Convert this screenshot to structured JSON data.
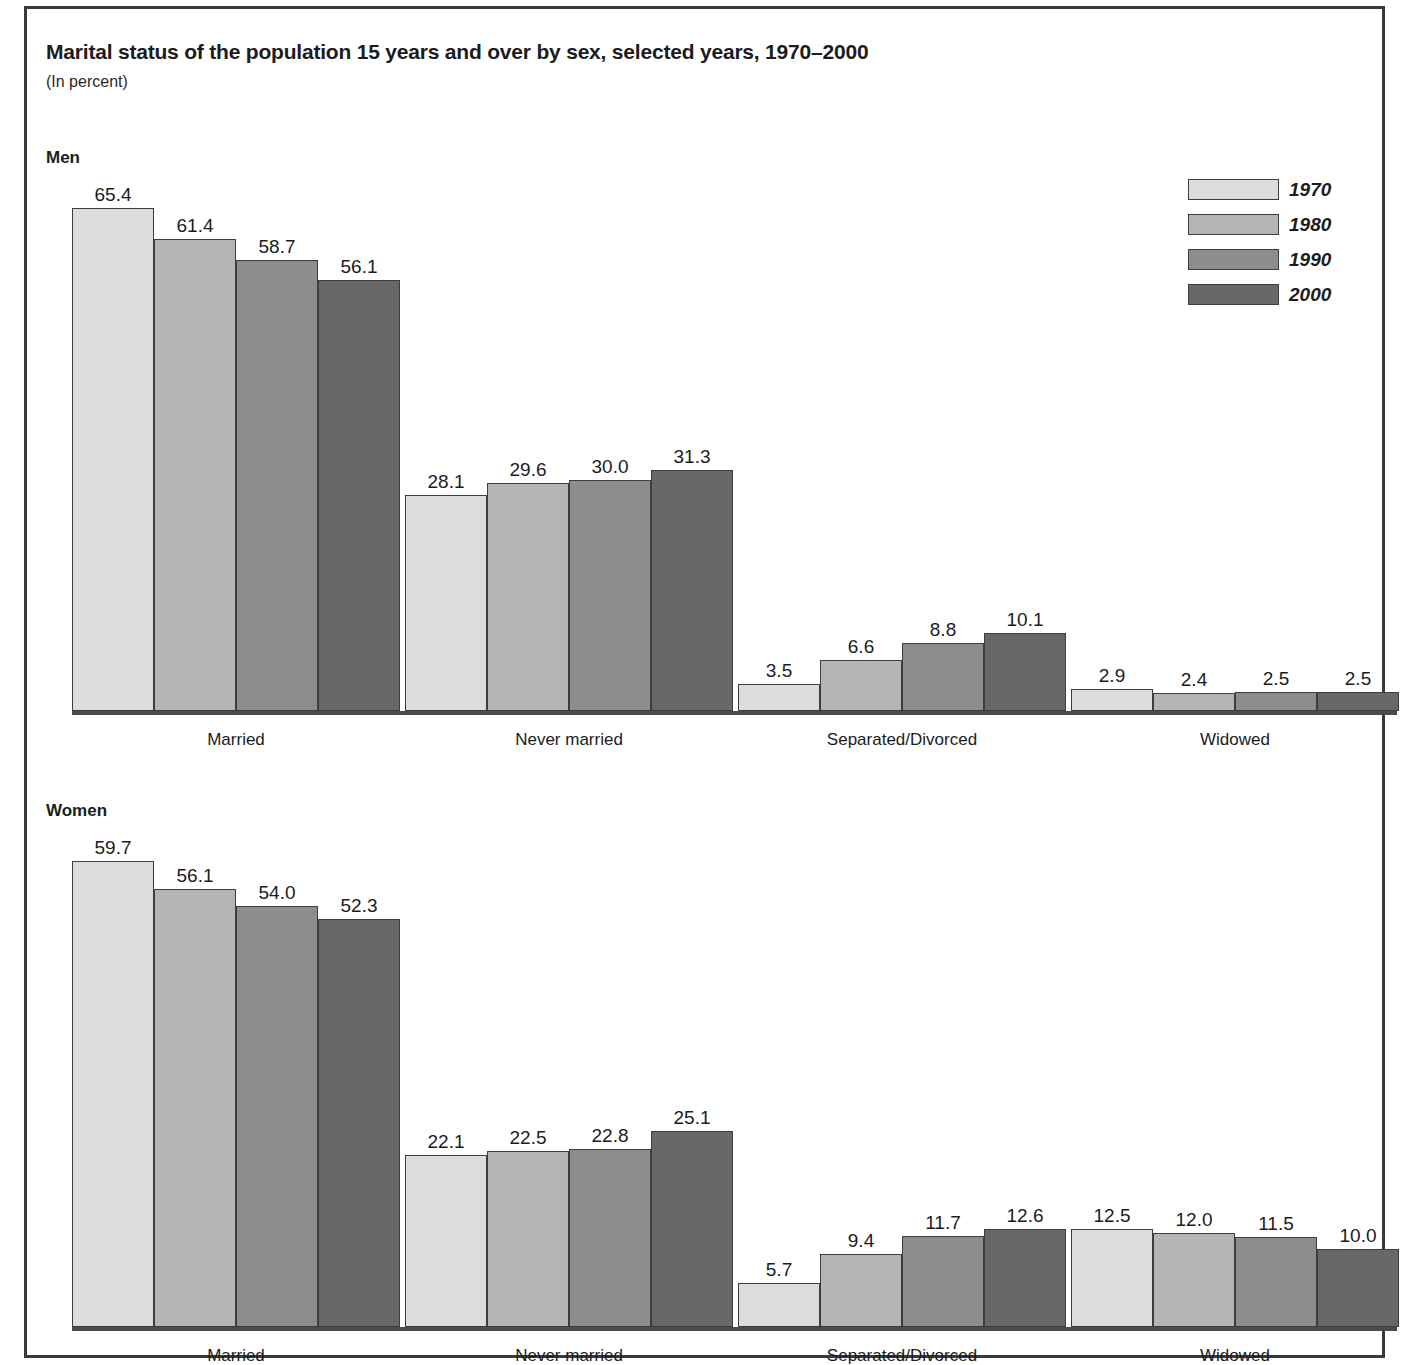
{
  "header": {
    "title": "Marital status of the population 15 years and over by sex, selected years, 1970–2000",
    "subtitle": "(In percent)"
  },
  "panels": [
    {
      "label": "Men"
    },
    {
      "label": "Women"
    }
  ],
  "legend": {
    "position": "top-right",
    "items": [
      {
        "label": "1970",
        "color": "#dcdcdc"
      },
      {
        "label": "1980",
        "color": "#b5b5b5"
      },
      {
        "label": "1990",
        "color": "#8d8d8d"
      },
      {
        "label": "2000",
        "color": "#686868"
      }
    ]
  },
  "chart_data": [
    {
      "type": "bar",
      "title": "Men",
      "xlabel": "",
      "ylabel": "Percent",
      "ylim": [
        0,
        70
      ],
      "grid": false,
      "legend_position": "top-right",
      "categories": [
        "Married",
        "Never married",
        "Separated/Divorced",
        "Widowed"
      ],
      "series": [
        {
          "name": "1970",
          "color": "#dcdcdc",
          "values": [
            65.4,
            28.1,
            3.5,
            2.9
          ]
        },
        {
          "name": "1980",
          "color": "#b5b5b5",
          "values": [
            61.4,
            29.6,
            6.6,
            2.4
          ]
        },
        {
          "name": "1990",
          "color": "#8d8d8d",
          "values": [
            58.7,
            30.0,
            8.8,
            2.5
          ]
        },
        {
          "name": "2000",
          "color": "#686868",
          "values": [
            56.1,
            31.3,
            10.1,
            2.5
          ]
        }
      ]
    },
    {
      "type": "bar",
      "title": "Women",
      "xlabel": "",
      "ylabel": "Percent",
      "ylim": [
        0,
        70
      ],
      "grid": false,
      "legend_position": "top-right",
      "categories": [
        "Married",
        "Never married",
        "Separated/Divorced",
        "Widowed"
      ],
      "series": [
        {
          "name": "1970",
          "color": "#dcdcdc",
          "values": [
            59.7,
            22.1,
            5.7,
            12.5
          ]
        },
        {
          "name": "1980",
          "color": "#b5b5b5",
          "values": [
            56.1,
            22.5,
            9.4,
            12.0
          ]
        },
        {
          "name": "1990",
          "color": "#8d8d8d",
          "values": [
            54.0,
            22.8,
            11.7,
            11.5
          ]
        },
        {
          "name": "2000",
          "color": "#686868",
          "values": [
            52.3,
            25.1,
            12.6,
            10.0
          ]
        }
      ]
    }
  ],
  "layout": {
    "men_panel_label_pos": {
      "left": 19,
      "top": 139
    },
    "women_panel_label_pos": {
      "left": 19,
      "top": 792
    },
    "plot_men": {
      "left": 45,
      "top": 203,
      "width": 1325,
      "height": 503
    },
    "plot_women": {
      "left": 45,
      "top": 856,
      "width": 1325,
      "height": 466
    },
    "scale_px_per_unit": 7.64,
    "group_width": 328,
    "group_gap": 5,
    "bar_width": 82
  }
}
